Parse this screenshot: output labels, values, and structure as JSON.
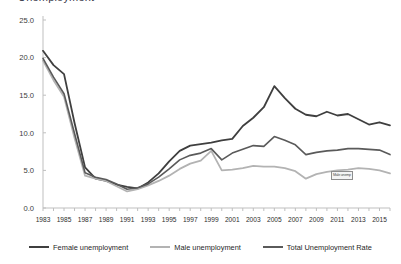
{
  "chart_data": {
    "type": "line",
    "title": "Unemployment",
    "subtitle": "",
    "xlabel": "",
    "ylabel": "",
    "xlim": [
      1983,
      2016
    ],
    "ylim": [
      0.0,
      25.0
    ],
    "yticks": [
      "0.0",
      "5.0",
      "10.0",
      "15.0",
      "20.0",
      "25.0"
    ],
    "ytick_values": [
      0.0,
      5.0,
      10.0,
      15.0,
      20.0,
      25.0
    ],
    "grid": false,
    "legend_position": "bottom",
    "x": [
      1983,
      1984,
      1985,
      1986,
      1987,
      1988,
      1989,
      1990,
      1991,
      1992,
      1993,
      1994,
      1995,
      1996,
      1997,
      1998,
      1999,
      2000,
      2001,
      2002,
      2003,
      2004,
      2005,
      2006,
      2007,
      2008,
      2009,
      2010,
      2011,
      2012,
      2013,
      2014,
      2015,
      2016
    ],
    "xticklabels": [
      "1983",
      "1985",
      "1987",
      "1989",
      "1991",
      "1993",
      "1995",
      "1997",
      "1999",
      "2001",
      "2003",
      "2005",
      "2007",
      "2009",
      "2011",
      "2013",
      "2015"
    ],
    "series": [
      {
        "name": "Female unemployment",
        "color": "#3f3f3f",
        "width": 1.8,
        "values": [
          20.9,
          19.0,
          17.8,
          11.3,
          5.4,
          3.9,
          3.6,
          3.1,
          2.8,
          2.6,
          3.4,
          4.6,
          6.2,
          7.6,
          8.3,
          8.5,
          8.7,
          9.0,
          9.2,
          10.9,
          12.0,
          13.4,
          16.2,
          14.6,
          13.2,
          12.4,
          12.2,
          12.8,
          12.3,
          12.5,
          11.8,
          11.1,
          11.4,
          11.0
        ]
      },
      {
        "name": "Male unemployment",
        "color": "#b3b3b3",
        "width": 1.8,
        "values": [
          19.6,
          17.0,
          14.8,
          9.3,
          4.3,
          3.9,
          3.6,
          2.9,
          2.2,
          2.5,
          3.0,
          3.6,
          4.3,
          5.2,
          5.9,
          6.3,
          7.6,
          5.0,
          5.1,
          5.3,
          5.6,
          5.5,
          5.5,
          5.3,
          4.9,
          3.9,
          4.5,
          4.8,
          5.0,
          5.1,
          5.3,
          5.2,
          5.0,
          4.6
        ]
      },
      {
        "name": "Total Unemployment Rate",
        "color": "#5a5a5a",
        "width": 1.6,
        "values": [
          19.9,
          17.4,
          15.2,
          9.9,
          4.7,
          4.1,
          3.8,
          3.2,
          2.5,
          2.7,
          3.2,
          4.1,
          5.2,
          6.4,
          7.0,
          7.3,
          7.9,
          6.4,
          7.3,
          7.8,
          8.3,
          8.2,
          9.5,
          9.0,
          8.4,
          7.1,
          7.4,
          7.6,
          7.7,
          7.9,
          7.9,
          7.8,
          7.7,
          7.1
        ]
      }
    ],
    "annotations": [
      {
        "text": "Male unemp",
        "x": 2011,
        "y": 4.9
      }
    ]
  },
  "legend": {
    "items": [
      {
        "label": "Female unemployment",
        "color": "#3f3f3f"
      },
      {
        "label": "Male unemployment",
        "color": "#b3b3b3"
      },
      {
        "label": "Total Unemployment Rate",
        "color": "#5a5a5a"
      }
    ]
  }
}
